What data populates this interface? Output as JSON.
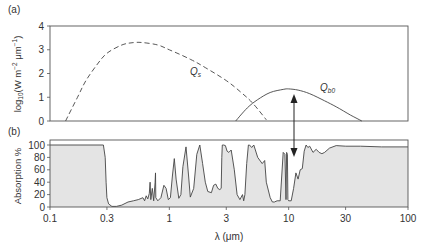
{
  "figure": {
    "panel_a_label": "(a)",
    "panel_b_label": "(b)",
    "xlabel": "λ (μm)"
  },
  "chart_data": [
    {
      "type": "line",
      "panel": "(a)",
      "title": "",
      "xlabel": "λ (μm)",
      "ylabel": "log10(W m−2 μm−1)",
      "xscale": "log",
      "xlim": [
        0.1,
        100
      ],
      "ylim": [
        0,
        4
      ],
      "yticks": [
        0,
        1,
        2,
        3,
        4
      ],
      "grid": false,
      "series": [
        {
          "name": "Q_s",
          "style": "dashed",
          "x": [
            0.135,
            0.17,
            0.2,
            0.25,
            0.3,
            0.4,
            0.5,
            0.6,
            0.8,
            1.0,
            1.5,
            2.0,
            3.0,
            4.0,
            5.0,
            6.5
          ],
          "y": [
            0.0,
            1.0,
            1.7,
            2.4,
            2.85,
            3.2,
            3.3,
            3.3,
            3.2,
            3.0,
            2.6,
            2.25,
            1.7,
            1.2,
            0.75,
            0.05
          ]
        },
        {
          "name": "Q_b0",
          "style": "solid",
          "x": [
            3.6,
            4.5,
            5.5,
            7.0,
            9.0,
            10.0,
            12.0,
            15.0,
            20.0,
            25.0,
            33.0,
            41.0
          ],
          "y": [
            0.0,
            0.55,
            0.9,
            1.2,
            1.33,
            1.35,
            1.3,
            1.15,
            0.85,
            0.6,
            0.25,
            0.0
          ]
        }
      ],
      "annotations": [
        {
          "text": "Q_s",
          "x": 1.35,
          "y": 2.9
        },
        {
          "text": "Q_b0",
          "x": 18,
          "y": 1.45
        }
      ]
    },
    {
      "type": "area",
      "panel": "(b)",
      "title": "",
      "xlabel": "λ (μm)",
      "ylabel": "Absorption %",
      "xscale": "log",
      "xlim": [
        0.1,
        100
      ],
      "ylim": [
        0,
        100
      ],
      "xticks": [
        0.1,
        0.3,
        1,
        3,
        10,
        30,
        100
      ],
      "xticklabels": [
        "0.1",
        "0.3",
        "1",
        "3",
        "10",
        "30",
        "100"
      ],
      "yticks": [
        0,
        20,
        40,
        60,
        80,
        100
      ],
      "grid": false,
      "series": [
        {
          "name": "Atmospheric absorption",
          "x": [
            0.1,
            0.28,
            0.29,
            0.295,
            0.3,
            0.31,
            0.33,
            0.36,
            0.4,
            0.45,
            0.5,
            0.55,
            0.6,
            0.62,
            0.64,
            0.66,
            0.68,
            0.69,
            0.7,
            0.72,
            0.74,
            0.76,
            0.765,
            0.77,
            0.8,
            0.85,
            0.9,
            0.94,
            0.98,
            1.02,
            1.06,
            1.1,
            1.14,
            1.2,
            1.25,
            1.3,
            1.38,
            1.45,
            1.5,
            1.6,
            1.7,
            1.8,
            1.9,
            2.0,
            2.1,
            2.25,
            2.35,
            2.45,
            2.55,
            2.65,
            2.72,
            2.75,
            2.78,
            2.85,
            2.95,
            3.05,
            3.15,
            3.3,
            3.5,
            3.7,
            3.9,
            4.1,
            4.2,
            4.3,
            4.45,
            4.6,
            4.7,
            4.9,
            5.1,
            5.5,
            6.0,
            6.3,
            6.5,
            7.0,
            7.3,
            7.6,
            8.0,
            8.5,
            9.0,
            9.3,
            9.5,
            9.6,
            9.75,
            9.85,
            10.0,
            10.5,
            11.0,
            11.5,
            12.0,
            12.5,
            13.0,
            13.5,
            14.0,
            14.5,
            15.0,
            16.0,
            17.0,
            18.0,
            19.0,
            20.0,
            22.0,
            25.0,
            30.0,
            40.0,
            60.0,
            100.0
          ],
          "y": [
            100,
            100,
            80,
            40,
            15,
            5,
            1,
            1,
            3,
            8,
            10,
            12,
            15,
            10,
            18,
            13,
            22,
            40,
            12,
            30,
            10,
            40,
            55,
            15,
            10,
            15,
            35,
            30,
            12,
            15,
            50,
            78,
            45,
            14,
            20,
            65,
            97,
            50,
            16,
            30,
            85,
            100,
            70,
            40,
            25,
            23,
            35,
            37,
            30,
            28,
            30,
            80,
            100,
            100,
            99,
            90,
            88,
            92,
            60,
            20,
            12,
            20,
            10,
            20,
            70,
            100,
            100,
            96,
            100,
            80,
            70,
            75,
            40,
            15,
            8,
            8,
            10,
            10,
            88,
            85,
            12,
            88,
            85,
            12,
            10,
            10,
            30,
            55,
            45,
            60,
            62,
            90,
            100,
            96,
            98,
            88,
            93,
            88,
            86,
            88,
            95,
            99,
            98,
            98,
            97,
            97
          ]
        }
      ],
      "annotations": [
        {
          "text": "double-headed arrow linking Q_b0 peak to 10 μm atmospheric window",
          "x": 10.5
        }
      ]
    }
  ]
}
